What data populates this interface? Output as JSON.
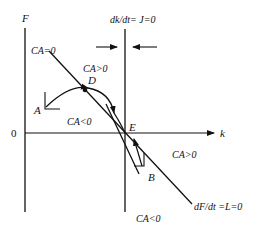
{
  "diagram": {
    "axes": {
      "y_label": "F",
      "x_label": "k",
      "origin_label": "0"
    },
    "loci": {
      "vertical_locus_label": "dk/dt= J=0",
      "downward_locus_label": "dF/dt =L=0",
      "ca_zero_label": "CA=0"
    },
    "points": {
      "A": "A",
      "B": "B",
      "D": "D",
      "E": "E"
    },
    "regions": {
      "upper_right": "CA>0",
      "upper_left": "CA<0",
      "lower_right": "CA>0",
      "lower_center": "CA<0"
    },
    "colors": {
      "ink": "#111111",
      "background": "#ffffff"
    }
  }
}
